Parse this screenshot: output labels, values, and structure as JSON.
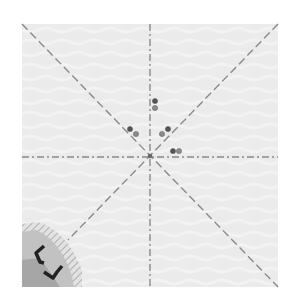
{
  "diagram": {
    "type": "origami-crease-pattern",
    "canvas": {
      "width": 301,
      "height": 307,
      "background": "#ffffff"
    },
    "paper": {
      "x": 22,
      "y": 24,
      "width": 256,
      "height": 263,
      "fill": "#ebebeb",
      "texture_fill": "#f4f4f4"
    },
    "center": {
      "x": 150,
      "y": 156
    },
    "creases": [
      {
        "name": "vertical-crease",
        "style": "dash-dot",
        "x1": 150,
        "y1": 24,
        "x2": 150,
        "y2": 287,
        "color": "#8a8a8a"
      },
      {
        "name": "horizontal-crease",
        "style": "dash-dot",
        "x1": 22,
        "y1": 157,
        "x2": 278,
        "y2": 157,
        "color": "#8a8a8a"
      },
      {
        "name": "diagonal-crease-tl-br",
        "style": "dashed",
        "x1": 22,
        "y1": 24,
        "x2": 278,
        "y2": 287,
        "color": "#8a8a8a"
      },
      {
        "name": "diagonal-crease-tr-bl",
        "style": "dashed",
        "x1": 278,
        "y1": 24,
        "x2": 68,
        "y2": 240,
        "color": "#8a8a8a"
      }
    ],
    "reference_dots": [
      {
        "x": 155,
        "y": 101,
        "shade": "dark"
      },
      {
        "x": 155,
        "y": 108,
        "shade": "light"
      },
      {
        "x": 130,
        "y": 129,
        "shade": "dark"
      },
      {
        "x": 136,
        "y": 134,
        "shade": "light"
      },
      {
        "x": 168,
        "y": 129,
        "shade": "dark"
      },
      {
        "x": 162,
        "y": 134,
        "shade": "light"
      },
      {
        "x": 173,
        "y": 151,
        "shade": "dark"
      },
      {
        "x": 179,
        "y": 151,
        "shade": "light"
      }
    ],
    "dot_colors": {
      "dark": "#555555",
      "light": "#8c8c8c",
      "center": "#666666"
    },
    "corner_fold": {
      "position": "bottom-left",
      "fill": "#c2c2c2",
      "edge_hatch": "#b0b0b0",
      "inner_fill": "#a6a6a6",
      "marks_color": "#222222"
    }
  }
}
